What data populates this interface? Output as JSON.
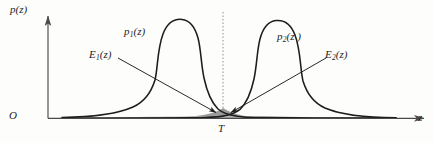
{
  "figure": {
    "background_color": "#fdfdfb",
    "ink_color": "#1d1d1d"
  },
  "axes": {
    "y_axis_label": "p(z)",
    "x_axis_label": "z",
    "origin_label": "O",
    "axis_color": "#4a4a4a"
  },
  "curves": [
    {
      "name": "p1",
      "label_base": "p",
      "label_subscript": "1",
      "label_arg": "(z)",
      "label_full": "p₁(z)",
      "stroke": "#1d1d1d",
      "description": "left density, long right tail, mode left of threshold"
    },
    {
      "name": "p2",
      "label_base": "p",
      "label_subscript": "2",
      "label_arg": "(z )",
      "label_full": "p₂(z )",
      "stroke": "#1d1d1d",
      "description": "right density, long left tail, mode right of threshold"
    }
  ],
  "error_regions": [
    {
      "name": "E1",
      "label_base": "E",
      "label_subscript": "1",
      "label_arg": "(z)",
      "label_full": "E₁(z)",
      "fill": "#8f8f8f",
      "side": "left-of-threshold",
      "description": "tail of p2 lying left of T"
    },
    {
      "name": "E2",
      "label_base": "E",
      "label_subscript": "2",
      "label_arg": "(z)",
      "label_full": "E₂(z)",
      "fill": "#c9c9c9",
      "side": "right-of-threshold",
      "description": "tail of p1 lying right of T"
    }
  ],
  "threshold": {
    "label": "T",
    "x_position": 223,
    "line_style": "dotted",
    "line_color": "#8a8a8a"
  },
  "leader_lines": [
    {
      "name": "e1-leader",
      "from_label": "E₁(z)",
      "arrow_target": "shaded region left of T"
    },
    {
      "name": "e2-leader",
      "from_label": "E₂(z)",
      "arrow_target": "shaded region right of T"
    }
  ]
}
